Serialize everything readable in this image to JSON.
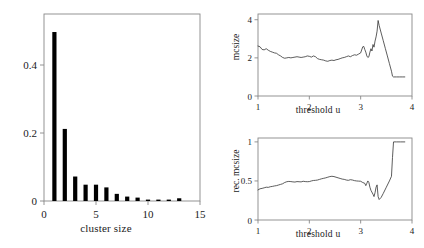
{
  "figure": {
    "background_color": "#ffffff",
    "axis_color": "#888888",
    "bar_color": "#000000",
    "line_color": "#333333"
  },
  "chart_data": [
    {
      "id": "cluster-size-histogram",
      "type": "bar",
      "title": "",
      "xlabel": "cluster size",
      "ylabel": "",
      "xlim": [
        0,
        15
      ],
      "ylim": [
        0,
        0.55
      ],
      "xticks": [
        0,
        5,
        10,
        15
      ],
      "xtick_labels": [
        "0",
        "5",
        "10",
        "15"
      ],
      "yticks": [
        0,
        0.2,
        0.4
      ],
      "ytick_labels": [
        "0",
        "0.2",
        "0.4"
      ],
      "grid": false,
      "legend": "none",
      "categories": [
        1,
        2,
        3,
        4,
        5,
        6,
        7,
        8,
        9,
        10,
        11,
        12,
        13
      ],
      "values": [
        0.497,
        0.212,
        0.072,
        0.048,
        0.048,
        0.04,
        0.021,
        0.013,
        0.01,
        0.003,
        0.004,
        0.004,
        0.008
      ]
    },
    {
      "id": "mcsize-vs-threshold",
      "type": "line",
      "title": "",
      "xlabel": "threshold u",
      "ylabel": "mcsize",
      "xlim": [
        1,
        4
      ],
      "ylim": [
        0,
        4.3
      ],
      "xticks": [
        1,
        2,
        3,
        4
      ],
      "xtick_labels": [
        "1",
        "2",
        "3",
        "4"
      ],
      "yticks": [
        0,
        2,
        4
      ],
      "ytick_labels": [
        "0",
        "2",
        "4"
      ],
      "grid": false,
      "legend": "none",
      "x": [
        1.0,
        1.04,
        1.08,
        1.12,
        1.16,
        1.2,
        1.24,
        1.28,
        1.32,
        1.36,
        1.4,
        1.44,
        1.48,
        1.52,
        1.56,
        1.6,
        1.64,
        1.68,
        1.72,
        1.76,
        1.8,
        1.84,
        1.88,
        1.92,
        1.96,
        2.0,
        2.04,
        2.08,
        2.12,
        2.16,
        2.2,
        2.24,
        2.28,
        2.32,
        2.36,
        2.4,
        2.44,
        2.48,
        2.52,
        2.56,
        2.6,
        2.64,
        2.68,
        2.72,
        2.76,
        2.8,
        2.84,
        2.88,
        2.92,
        2.96,
        3.0,
        3.04,
        3.06,
        3.08,
        3.1,
        3.12,
        3.14,
        3.16,
        3.18,
        3.2,
        3.22,
        3.24,
        3.26,
        3.28,
        3.3,
        3.32,
        3.34,
        3.36,
        3.4,
        3.44,
        3.48,
        3.52,
        3.56,
        3.6,
        3.62,
        3.64,
        3.7,
        3.76,
        3.82,
        3.86
      ],
      "y": [
        2.62,
        2.58,
        2.44,
        2.42,
        2.48,
        2.4,
        2.34,
        2.3,
        2.26,
        2.24,
        2.16,
        2.1,
        2.02,
        1.98,
        2.0,
        2.02,
        2.0,
        2.02,
        2.04,
        2.06,
        2.04,
        2.02,
        2.04,
        2.06,
        2.1,
        2.08,
        2.04,
        2.1,
        2.06,
        1.96,
        1.92,
        1.9,
        1.88,
        1.84,
        1.82,
        1.86,
        1.88,
        1.86,
        1.9,
        1.92,
        1.96,
        2.0,
        2.02,
        2.06,
        2.1,
        2.06,
        2.12,
        2.16,
        2.14,
        2.2,
        2.26,
        2.58,
        2.6,
        2.44,
        2.3,
        2.1,
        2.02,
        2.06,
        2.3,
        2.48,
        2.36,
        2.7,
        2.56,
        2.88,
        3.1,
        3.4,
        3.96,
        3.7,
        3.3,
        2.9,
        2.5,
        2.1,
        1.7,
        1.3,
        1.04,
        1.0,
        1.0,
        1.0,
        1.0,
        1.0
      ]
    },
    {
      "id": "rec-mcsize-vs-threshold",
      "type": "line",
      "title": "",
      "xlabel": "threshold u",
      "ylabel": "rec. mcsize",
      "xlim": [
        1,
        4
      ],
      "ylim": [
        0,
        1.05
      ],
      "xticks": [
        1,
        2,
        3,
        4
      ],
      "xtick_labels": [
        "1",
        "2",
        "3",
        "4"
      ],
      "yticks": [
        0,
        0.5,
        1
      ],
      "ytick_labels": [
        "0",
        "0.5",
        "1"
      ],
      "grid": false,
      "legend": "none",
      "x": [
        1.0,
        1.04,
        1.08,
        1.12,
        1.16,
        1.2,
        1.24,
        1.28,
        1.32,
        1.36,
        1.4,
        1.44,
        1.48,
        1.52,
        1.56,
        1.6,
        1.64,
        1.68,
        1.72,
        1.76,
        1.8,
        1.84,
        1.88,
        1.92,
        1.96,
        2.0,
        2.04,
        2.08,
        2.12,
        2.16,
        2.2,
        2.24,
        2.28,
        2.32,
        2.36,
        2.4,
        2.44,
        2.48,
        2.52,
        2.56,
        2.6,
        2.64,
        2.68,
        2.72,
        2.76,
        2.8,
        2.84,
        2.88,
        2.92,
        2.96,
        3.0,
        3.04,
        3.08,
        3.1,
        3.12,
        3.14,
        3.16,
        3.18,
        3.2,
        3.24,
        3.26,
        3.28,
        3.3,
        3.32,
        3.34,
        3.36,
        3.4,
        3.44,
        3.5,
        3.56,
        3.6,
        3.62,
        3.64,
        3.7,
        3.78,
        3.86
      ],
      "y": [
        0.385,
        0.4,
        0.405,
        0.412,
        0.42,
        0.418,
        0.426,
        0.43,
        0.436,
        0.44,
        0.448,
        0.456,
        0.464,
        0.48,
        0.49,
        0.494,
        0.492,
        0.488,
        0.486,
        0.492,
        0.49,
        0.488,
        0.496,
        0.492,
        0.49,
        0.492,
        0.5,
        0.506,
        0.508,
        0.512,
        0.52,
        0.528,
        0.534,
        0.54,
        0.548,
        0.556,
        0.56,
        0.556,
        0.548,
        0.54,
        0.532,
        0.524,
        0.52,
        0.512,
        0.508,
        0.516,
        0.512,
        0.504,
        0.5,
        0.498,
        0.496,
        0.48,
        0.47,
        0.44,
        0.47,
        0.5,
        0.48,
        0.42,
        0.38,
        0.33,
        0.3,
        0.35,
        0.42,
        0.45,
        0.3,
        0.262,
        0.29,
        0.34,
        0.42,
        0.5,
        0.56,
        0.8,
        1.0,
        1.0,
        1.0,
        1.0
      ]
    }
  ]
}
